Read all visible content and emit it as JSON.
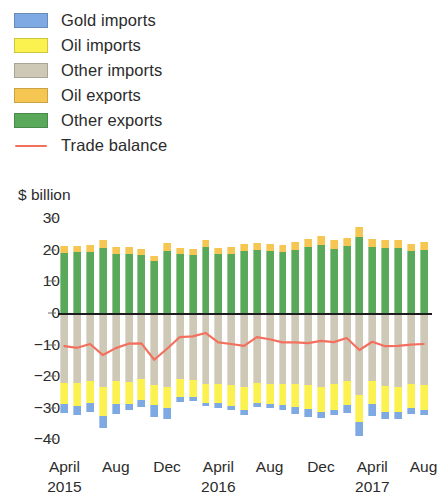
{
  "legend": {
    "items": [
      {
        "label": "Gold imports",
        "color": "#7fa9e2",
        "type": "swatch",
        "name": "gold-imports"
      },
      {
        "label": "Oil imports",
        "color": "#fbf24f",
        "type": "swatch",
        "name": "oil-imports"
      },
      {
        "label": "Other imports",
        "color": "#cec8b7",
        "type": "swatch",
        "name": "other-imports"
      },
      {
        "label": "Oil exports",
        "color": "#f6c652",
        "type": "swatch",
        "name": "oil-exports"
      },
      {
        "label": "Other exports",
        "color": "#5aa95b",
        "type": "swatch",
        "name": "other-exports"
      },
      {
        "label": "Trade balance",
        "color": "#f4705e",
        "type": "line",
        "name": "trade-balance"
      }
    ]
  },
  "axis": {
    "unit_label": "$ billion",
    "y_ticks": [
      "30",
      "20",
      "10",
      "0",
      "−10",
      "−20",
      "−30",
      "−40"
    ],
    "x_ticks": [
      {
        "month": "April",
        "year": "2015",
        "index": 0
      },
      {
        "month": "Aug",
        "year": "",
        "index": 4
      },
      {
        "month": "Dec",
        "year": "",
        "index": 8
      },
      {
        "month": "April",
        "year": "2016",
        "index": 12
      },
      {
        "month": "Aug",
        "year": "",
        "index": 16
      },
      {
        "month": "Dec",
        "year": "",
        "index": 20
      },
      {
        "month": "April",
        "year": "2017",
        "index": 24
      },
      {
        "month": "Aug",
        "year": "",
        "index": 28
      }
    ]
  },
  "chart_data": {
    "type": "bar",
    "title": "",
    "subtitle": "",
    "xlabel": "",
    "ylabel": "$ billion",
    "ylim": [
      -44,
      32
    ],
    "y_ticks": [
      30,
      20,
      10,
      0,
      -10,
      -20,
      -30,
      -40
    ],
    "grid": false,
    "legend_position": "top-left",
    "stacked": true,
    "categories": [
      "April 2015",
      "May 2015",
      "June 2015",
      "July 2015",
      "Aug 2015",
      "Sept 2015",
      "Oct 2015",
      "Nov 2015",
      "Dec 2015",
      "Jan 2016",
      "Feb 2016",
      "March 2016",
      "April 2016",
      "May 2016",
      "June 2016",
      "July 2016",
      "Aug 2016",
      "Sept 2016",
      "Oct 2016",
      "Nov 2016",
      "Dec 2016",
      "Jan 2017",
      "Feb 2017",
      "March 2017",
      "April 2017",
      "May 2017",
      "June 2017",
      "July 2017",
      "Aug 2017"
    ],
    "series": [
      {
        "name": "Other exports",
        "stack": "exports",
        "color": "#5aa95b",
        "values": [
          19.0,
          19.2,
          19.3,
          20.6,
          18.7,
          18.8,
          18.3,
          16.4,
          19.8,
          18.6,
          18.5,
          20.8,
          18.7,
          18.8,
          19.6,
          19.9,
          19.5,
          19.2,
          20.1,
          20.8,
          21.7,
          20.4,
          21.1,
          24.2,
          21.0,
          20.5,
          20.6,
          19.6,
          20.1
        ]
      },
      {
        "name": "Oil exports",
        "stack": "exports",
        "color": "#f6c652",
        "values": [
          2.3,
          2.1,
          2.2,
          2.4,
          2.1,
          2.2,
          2.0,
          1.8,
          2.4,
          2.0,
          1.9,
          2.3,
          2.0,
          2.1,
          2.3,
          2.4,
          2.3,
          2.2,
          2.5,
          2.6,
          2.8,
          2.6,
          2.7,
          2.9,
          2.6,
          2.6,
          2.6,
          2.4,
          2.5
        ]
      }
    ],
    "import_series": [
      {
        "name": "Other imports",
        "stack": "imports",
        "color": "#cec8b7",
        "values": [
          -22.0,
          -22.2,
          -21.6,
          -23.3,
          -21.5,
          -21.8,
          -21.0,
          -22.8,
          -23.3,
          -21.0,
          -21.1,
          -22.4,
          -22.6,
          -22.8,
          -23.4,
          -22.0,
          -22.6,
          -22.6,
          -22.6,
          -22.9,
          -23.4,
          -22.4,
          -21.5,
          -26.0,
          -21.4,
          -23.0,
          -23.4,
          -22.5,
          -22.9
        ]
      },
      {
        "name": "Oil imports",
        "stack": "imports",
        "color": "#fbf24f",
        "values": [
          -6.8,
          -7.2,
          -7.0,
          -9.4,
          -7.2,
          -7.1,
          -6.5,
          -6.2,
          -6.8,
          -5.6,
          -5.4,
          -6.0,
          -5.9,
          -6.5,
          -7.3,
          -6.6,
          -6.3,
          -6.4,
          -7.0,
          -7.4,
          -7.8,
          -8.3,
          -7.6,
          -8.6,
          -7.5,
          -8.2,
          -8.0,
          -7.6,
          -7.8
        ]
      },
      {
        "name": "Gold imports",
        "stack": "imports",
        "color": "#7fa9e2",
        "values": [
          -3.0,
          -2.9,
          -2.7,
          -3.6,
          -3.2,
          -1.8,
          -2.4,
          -4.0,
          -3.4,
          -1.6,
          -1.3,
          -1.0,
          -1.5,
          -1.4,
          -1.6,
          -1.3,
          -1.2,
          -1.7,
          -2.3,
          -2.6,
          -2.1,
          -1.5,
          -2.6,
          -4.2,
          -3.8,
          -2.4,
          -2.2,
          -1.9,
          -1.7
        ]
      }
    ],
    "line_series": {
      "name": "Trade balance",
      "color": "#f4705e",
      "values": [
        -10.5,
        -11.0,
        -9.8,
        -13.3,
        -11.1,
        -9.7,
        -9.6,
        -14.8,
        -11.3,
        -7.6,
        -7.4,
        -6.3,
        -9.3,
        -9.8,
        -10.4,
        -7.6,
        -8.3,
        -9.3,
        -9.3,
        -9.5,
        -8.8,
        -9.2,
        -7.9,
        -11.7,
        -9.1,
        -10.5,
        -10.4,
        -10.0,
        -9.8
      ]
    }
  }
}
